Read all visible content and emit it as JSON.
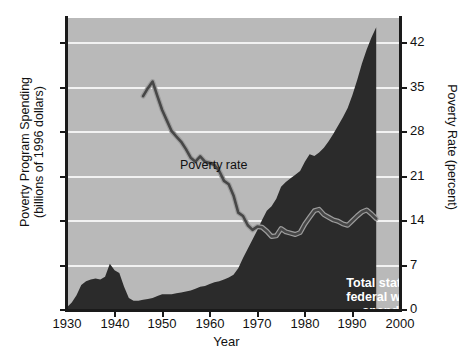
{
  "chart_data": {
    "type": "area",
    "title": "",
    "xlabel": "Year",
    "ylabel_left": "Poverty Program Spending\n(billions of 1996 dollars)",
    "ylabel_right": "Poverty Rate (percent)",
    "xlim": [
      1930,
      2000
    ],
    "ylim_left": [
      0,
      315
    ],
    "ylim_right": [
      0,
      44.1
    ],
    "xticks": [
      1930,
      1940,
      1950,
      1960,
      1970,
      1980,
      1990,
      2000
    ],
    "yticks_left": [
      0,
      50,
      100,
      150,
      200,
      250,
      300
    ],
    "yticks_right": [
      0,
      7,
      14,
      21,
      28,
      35,
      42
    ],
    "grid": "horizontal",
    "legend_position": "in-plot annotations",
    "series": [
      {
        "name": "Total state and federal welfare spending",
        "type": "area",
        "axis": "left",
        "units": "billions of 1996 dollars",
        "color": "#2b2b2b",
        "annotation_lines": [
          "Total state and",
          "federal welfare spending"
        ],
        "x": [
          1930,
          1931,
          1932,
          1933,
          1934,
          1935,
          1936,
          1937,
          1938,
          1939,
          1940,
          1941,
          1942,
          1943,
          1944,
          1945,
          1946,
          1947,
          1948,
          1949,
          1950,
          1951,
          1952,
          1953,
          1954,
          1955,
          1956,
          1957,
          1958,
          1959,
          1960,
          1961,
          1962,
          1963,
          1964,
          1965,
          1966,
          1967,
          1968,
          1969,
          1970,
          1971,
          1972,
          1973,
          1974,
          1975,
          1976,
          1977,
          1978,
          1979,
          1980,
          1981,
          1982,
          1983,
          1984,
          1985,
          1986,
          1987,
          1988,
          1989,
          1990,
          1991,
          1992,
          1993,
          1994,
          1995
        ],
        "values": [
          3,
          8,
          16,
          27,
          31,
          33,
          34,
          33,
          36,
          50,
          43,
          40,
          25,
          13,
          10,
          10,
          11,
          12,
          13,
          15,
          17,
          17,
          17,
          18,
          19,
          20,
          21,
          23,
          25,
          26,
          28,
          30,
          31,
          33,
          35,
          38,
          45,
          56,
          66,
          76,
          86,
          97,
          107,
          112,
          120,
          133,
          138,
          142,
          146,
          150,
          160,
          168,
          166,
          170,
          175,
          182,
          190,
          199,
          208,
          218,
          232,
          248,
          266,
          281,
          294,
          305
        ]
      },
      {
        "name": "Poverty rate",
        "type": "line",
        "axis": "right",
        "units": "percent",
        "color": "#4a4a4a",
        "annotation": "Poverty rate",
        "x": [
          1946,
          1947,
          1948,
          1949,
          1950,
          1951,
          1952,
          1953,
          1954,
          1955,
          1956,
          1957,
          1958,
          1959,
          1960,
          1961,
          1962,
          1963,
          1964,
          1965,
          1966,
          1967,
          1968,
          1969,
          1970,
          1971,
          1972,
          1973,
          1974,
          1975,
          1976,
          1977,
          1978,
          1979,
          1980,
          1981,
          1982,
          1983,
          1984,
          1985,
          1986,
          1987,
          1988,
          1989,
          1990,
          1991,
          1992,
          1993,
          1994,
          1995
        ],
        "values": [
          32.3,
          33.5,
          34.5,
          32.3,
          30.2,
          28.6,
          27.0,
          26.2,
          25.4,
          24.3,
          23.0,
          22.4,
          23.2,
          22.4,
          22.2,
          21.9,
          21.0,
          19.5,
          19.0,
          17.3,
          14.7,
          14.2,
          12.8,
          12.1,
          12.6,
          12.5,
          11.9,
          11.1,
          11.2,
          12.3,
          11.8,
          11.6,
          11.4,
          11.7,
          13.0,
          14.0,
          15.0,
          15.2,
          14.4,
          14.0,
          13.6,
          13.4,
          13.0,
          12.8,
          13.5,
          14.2,
          14.8,
          15.1,
          14.5,
          13.8
        ]
      }
    ]
  },
  "axes": {
    "x": {
      "title": "Year",
      "ticks": [
        "1930",
        "1940",
        "1950",
        "1960",
        "1970",
        "1980",
        "1990",
        "2000"
      ]
    },
    "y_left": {
      "title_line1": "Poverty Program Spending",
      "title_line2": "(billions of 1996 dollars)",
      "ticks": [
        "300",
        "250",
        "200",
        "150",
        "100",
        "50",
        "0"
      ]
    },
    "y_right": {
      "title": "Poverty Rate (percent)",
      "ticks": [
        "42",
        "35",
        "28",
        "21",
        "14",
        "7",
        "0"
      ]
    }
  },
  "annotations": {
    "poverty_rate": "Poverty rate",
    "spending_line1": "Total state and",
    "spending_line2": "federal welfare spending"
  },
  "colors": {
    "plot_background": "#b9b9b9",
    "area_fill": "#2b2b2b",
    "gridline": "#f2f2f2",
    "line": "#4a4a4a",
    "axis": "#1a1a1a",
    "page_background": "#ffffff"
  }
}
